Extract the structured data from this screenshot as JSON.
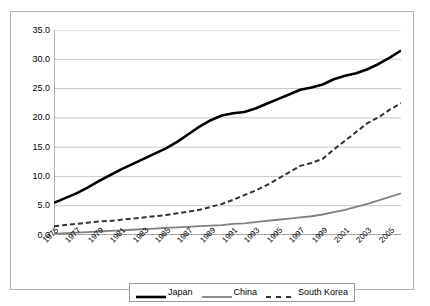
{
  "chart_data": {
    "type": "line",
    "title": "",
    "subtitle": "",
    "xlabel": "",
    "ylabel": "",
    "grid": true,
    "legend_position": "bottom-center",
    "ylim": [
      0.0,
      35.0
    ],
    "ytick_labels": [
      "35.0",
      "30.0",
      "25.0",
      "20.0",
      "15.0",
      "10.0",
      "5.0",
      "0.0"
    ],
    "ytick_values": [
      35.0,
      30.0,
      25.0,
      20.0,
      15.0,
      10.0,
      5.0,
      0.0
    ],
    "x": [
      1975,
      1976,
      1977,
      1978,
      1979,
      1980,
      1981,
      1982,
      1983,
      1984,
      1985,
      1986,
      1987,
      1988,
      1989,
      1990,
      1991,
      1992,
      1993,
      1994,
      1995,
      1996,
      1997,
      1998,
      1999,
      2000,
      2001,
      2002,
      2003,
      2004,
      2005,
      2006
    ],
    "xtick_labels": [
      "1975",
      "1977",
      "1979",
      "1981",
      "1983",
      "1985",
      "1987",
      "1989",
      "1991",
      "1993",
      "1995",
      "1997",
      "1999",
      "2001",
      "2003",
      "2005"
    ],
    "xtick_values": [
      1975,
      1977,
      1979,
      1981,
      1983,
      1985,
      1987,
      1989,
      1991,
      1993,
      1995,
      1997,
      1999,
      2001,
      2003,
      2005
    ],
    "series": [
      {
        "name": "Japan",
        "style": "solid",
        "color": "#000000",
        "width": 2.6,
        "values": [
          5.5,
          6.3,
          7.1,
          8.1,
          9.2,
          10.2,
          11.2,
          12.1,
          13.0,
          13.9,
          14.8,
          15.9,
          17.2,
          18.5,
          19.6,
          20.4,
          20.8,
          21.0,
          21.6,
          22.4,
          23.2,
          24.0,
          24.8,
          25.2,
          25.7,
          26.6,
          27.2,
          27.6,
          28.3,
          29.2,
          30.3,
          31.5
        ]
      },
      {
        "name": "China",
        "style": "solid",
        "color": "#808080",
        "width": 1.8,
        "values": [
          0.2,
          0.3,
          0.4,
          0.5,
          0.6,
          0.7,
          0.8,
          0.9,
          1.0,
          1.1,
          1.2,
          1.3,
          1.4,
          1.5,
          1.6,
          1.7,
          1.9,
          2.0,
          2.2,
          2.4,
          2.6,
          2.8,
          3.0,
          3.2,
          3.5,
          3.9,
          4.3,
          4.8,
          5.3,
          5.9,
          6.5,
          7.1
        ]
      },
      {
        "name": "South Korea",
        "style": "dashed",
        "color": "#333333",
        "width": 2.0,
        "values": [
          1.5,
          1.7,
          1.9,
          2.1,
          2.3,
          2.4,
          2.6,
          2.8,
          3.0,
          3.2,
          3.4,
          3.7,
          4.0,
          4.3,
          4.8,
          5.3,
          6.0,
          6.8,
          7.6,
          8.5,
          9.6,
          10.7,
          11.8,
          12.3,
          13.0,
          14.6,
          16.1,
          17.6,
          19.1,
          20.1,
          21.4,
          22.5
        ]
      }
    ]
  },
  "legend": {
    "items": [
      {
        "label": "Japan"
      },
      {
        "label": "China"
      },
      {
        "label": "South Korea"
      }
    ]
  }
}
